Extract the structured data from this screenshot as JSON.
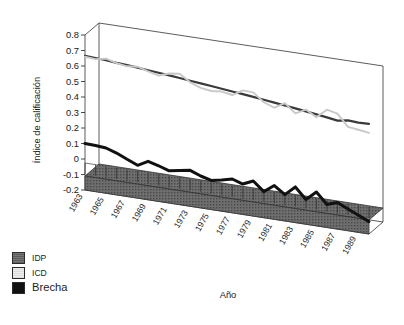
{
  "chart_data": {
    "type": "line",
    "title": "",
    "xlabel": "Año",
    "ylabel": "Índice de calificación",
    "ylim": [
      -0.2,
      0.8
    ],
    "yticks": [
      "0.8",
      "0.7",
      "0.6",
      "0.5",
      "0.4",
      "0.3",
      "0.2",
      "0.1",
      "0",
      "-0.1",
      "-0.2"
    ],
    "grid": false,
    "legend_position": "bottom-left",
    "projection": "3d-perspective",
    "x": [
      1963,
      1964,
      1965,
      1966,
      1967,
      1968,
      1969,
      1970,
      1971,
      1972,
      1973,
      1974,
      1975,
      1976,
      1977,
      1978,
      1979,
      1980,
      1981,
      1982,
      1983,
      1984,
      1985,
      1986,
      1987,
      1988,
      1989,
      1990
    ],
    "xtick_labels": [
      "1963",
      "1965",
      "1967",
      "1969",
      "1971",
      "1973",
      "1975",
      "1977",
      "1979",
      "1981",
      "1983",
      "1985",
      "1987",
      "1989"
    ],
    "series": [
      {
        "name": "IDP",
        "color": "#3a3a3a",
        "values": [
          0.665,
          0.662,
          0.658,
          0.652,
          0.648,
          0.642,
          0.636,
          0.63,
          0.624,
          0.617,
          0.61,
          0.604,
          0.597,
          0.59,
          0.583,
          0.576,
          0.569,
          0.561,
          0.553,
          0.545,
          0.537,
          0.528,
          0.519,
          0.51,
          0.5,
          0.512,
          0.508,
          0.51
        ]
      },
      {
        "name": "ICD",
        "color": "#c9c9c9",
        "values": [
          0.66,
          0.655,
          0.668,
          0.65,
          0.64,
          0.648,
          0.628,
          0.612,
          0.636,
          0.645,
          0.6,
          0.575,
          0.565,
          0.572,
          0.56,
          0.6,
          0.598,
          0.545,
          0.52,
          0.56,
          0.505,
          0.54,
          0.5,
          0.56,
          0.545,
          0.47,
          0.462,
          0.452
        ]
      },
      {
        "name": "Brecha",
        "color": "#111111",
        "values": [
          0.1,
          0.098,
          0.092,
          0.07,
          0.04,
          0.012,
          0.048,
          0.03,
          0.008,
          0.02,
          0.032,
          0.006,
          -0.012,
          0.002,
          0.018,
          -0.004,
          0.026,
          -0.032,
          0.018,
          -0.03,
          0.03,
          -0.04,
          0.018,
          -0.052,
          -0.028,
          -0.06,
          -0.09,
          -0.12
        ]
      }
    ]
  },
  "legend": {
    "items": [
      {
        "label": "IDP"
      },
      {
        "label": "ICD"
      },
      {
        "label": "Brecha"
      }
    ]
  }
}
